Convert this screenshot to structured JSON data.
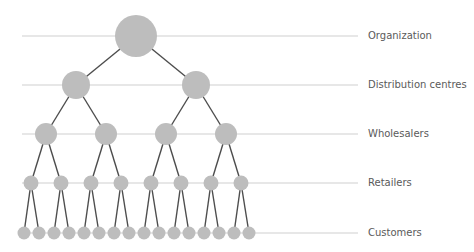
{
  "diagram": {
    "colors": {
      "node_fill": "#bdbdbd",
      "connector": "#4d4d4d",
      "guide_line": "#cfcfcf",
      "label": "#5a5a5a"
    },
    "levels": [
      {
        "label": "Organization",
        "y": 36,
        "radius": 21,
        "x": [
          136
        ]
      },
      {
        "label": "Distribution centres",
        "y": 85,
        "radius": 14,
        "x": [
          76,
          196
        ]
      },
      {
        "label": "Wholesalers",
        "y": 134,
        "radius": 11,
        "x": [
          46,
          106,
          166,
          226
        ]
      },
      {
        "label": "Retailers",
        "y": 183,
        "radius": 7.5,
        "x": [
          31,
          61,
          91,
          121,
          151,
          181,
          211,
          241
        ]
      },
      {
        "label": "Customers",
        "y": 233,
        "radius": 6.5,
        "x": [
          24,
          39,
          54,
          69,
          84,
          99,
          114,
          129,
          144,
          159,
          174,
          189,
          204,
          219,
          234,
          249
        ]
      }
    ],
    "guide_start_x": 22,
    "guide_end_x": 358,
    "label_x": 368
  }
}
